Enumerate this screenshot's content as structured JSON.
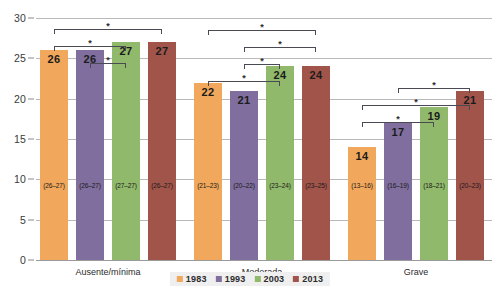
{
  "chart_data": {
    "type": "bar",
    "title": "",
    "subtitle": "",
    "xlabel": "",
    "ylabel": "",
    "ylim": [
      0,
      30
    ],
    "yticks": [
      0,
      5,
      10,
      15,
      20,
      25,
      30
    ],
    "ytick_labels": [
      "0",
      "5",
      "10",
      "15",
      "20",
      "25",
      "30"
    ],
    "grid": true,
    "legend_position": "bottom",
    "categories": [
      "Ausente/mínima",
      "Moderada",
      "Grave"
    ],
    "series": [
      {
        "name": "1983",
        "color": "#F2A85C",
        "values": [
          26,
          22,
          14
        ],
        "ci_labels": [
          "(26–27)",
          "(21–23)",
          "(13–16)"
        ]
      },
      {
        "name": "1993",
        "color": "#7F6E9E",
        "values": [
          26,
          21,
          17
        ],
        "ci_labels": [
          "(26–27)",
          "(20–22)",
          "(16–19)"
        ]
      },
      {
        "name": "2003",
        "color": "#91B96B",
        "values": [
          27,
          24,
          19
        ],
        "ci_labels": [
          "(27–27)",
          "(23–24)",
          "(18–21)"
        ]
      },
      {
        "name": "2013",
        "color": "#A1544A",
        "values": [
          27,
          24,
          21
        ],
        "ci_labels": [
          "(26–27)",
          "(23–25)",
          "(20–23)"
        ]
      }
    ],
    "significance_marker": "*",
    "significance_brackets": [
      {
        "group": 0,
        "from": 0,
        "to": 3,
        "level": 3,
        "marker": "*"
      },
      {
        "group": 0,
        "from": 0,
        "to": 2,
        "level": 2,
        "marker": "*"
      },
      {
        "group": 0,
        "from": 1,
        "to": 2,
        "level": 1,
        "marker": "*"
      },
      {
        "group": 1,
        "from": 0,
        "to": 3,
        "level": 4,
        "marker": "*"
      },
      {
        "group": 1,
        "from": 1,
        "to": 3,
        "level": 3,
        "marker": "*"
      },
      {
        "group": 1,
        "from": 1,
        "to": 2,
        "level": 2,
        "marker": "*"
      },
      {
        "group": 1,
        "from": 0,
        "to": 2,
        "level": 1,
        "marker": "*"
      },
      {
        "group": 2,
        "from": 1,
        "to": 3,
        "level": 3,
        "marker": "*"
      },
      {
        "group": 2,
        "from": 0,
        "to": 3,
        "level": 2,
        "marker": "*"
      },
      {
        "group": 2,
        "from": 0,
        "to": 2,
        "level": 1,
        "marker": "*"
      }
    ]
  },
  "legend": {
    "items": [
      {
        "label": "1983",
        "color": "#F2A85C"
      },
      {
        "label": "1993",
        "color": "#7F6E9E"
      },
      {
        "label": "2003",
        "color": "#91B96B"
      },
      {
        "label": "2013",
        "color": "#A1544A"
      }
    ]
  }
}
